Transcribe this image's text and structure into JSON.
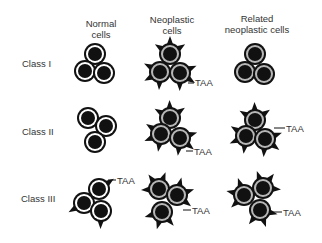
{
  "columns": [
    {
      "id": "normal",
      "line1": "Normal",
      "line2": "cells",
      "x": 101
    },
    {
      "id": "neoplastic",
      "line1": "Neoplastic",
      "line2": "cells",
      "x": 172
    },
    {
      "id": "related",
      "line1": "Related",
      "line2": "neoplastic cells",
      "x": 257
    }
  ],
  "rows": [
    {
      "label": "Class I",
      "y": 64
    },
    {
      "label": "Class II",
      "y": 132
    },
    {
      "label": "Class III",
      "y": 199
    }
  ],
  "annotation_label": "TAA",
  "colors": {
    "outline": "#111111",
    "normal_fill": "#ffffff",
    "neoplastic_fill": "#b8b8b8",
    "nucleus": "#111111",
    "text": "#333333"
  },
  "groups": [
    {
      "row": "Class I",
      "col": "normal",
      "type": "normal",
      "spikes": false,
      "cells": [
        [
          95,
          54
        ],
        [
          85,
          71
        ],
        [
          104,
          73
        ]
      ],
      "taa": null
    },
    {
      "row": "Class I",
      "col": "neoplastic",
      "type": "neoplastic",
      "spikes": true,
      "cells": [
        [
          170,
          54
        ],
        [
          160,
          72
        ],
        [
          180,
          73
        ]
      ],
      "taa": {
        "from": [
          188,
          83
        ],
        "to": [
          194,
          83
        ],
        "text_x": 195,
        "text_y": 86
      }
    },
    {
      "row": "Class I",
      "col": "related",
      "type": "neoplastic",
      "spikes": false,
      "cells": [
        [
          255,
          54
        ],
        [
          245,
          72
        ],
        [
          264,
          74
        ]
      ],
      "taa": null
    },
    {
      "row": "Class II",
      "col": "normal",
      "type": "normal",
      "spikes": false,
      "cells": [
        [
          88,
          118
        ],
        [
          106,
          126
        ],
        [
          95,
          142
        ]
      ],
      "taa": null
    },
    {
      "row": "Class II",
      "col": "neoplastic",
      "type": "neoplastic",
      "spikes": true,
      "cells": [
        [
          170,
          118
        ],
        [
          161,
          134
        ],
        [
          180,
          138
        ]
      ],
      "taa": {
        "from": [
          186,
          151
        ],
        "to": [
          193,
          151
        ],
        "text_x": 194,
        "text_y": 155
      }
    },
    {
      "row": "Class II",
      "col": "related",
      "type": "neoplastic",
      "spikes": true,
      "cells": [
        [
          255,
          120
        ],
        [
          246,
          136
        ],
        [
          265,
          139
        ]
      ],
      "taa": {
        "from": [
          274,
          128
        ],
        "to": [
          285,
          128
        ],
        "text_x": 286,
        "text_y": 132
      }
    },
    {
      "row": "Class III",
      "col": "normal",
      "type": "normal",
      "spikes": "few",
      "cells": [
        [
          99,
          189
        ],
        [
          84,
          203
        ],
        [
          101,
          211
        ]
      ],
      "taa": {
        "from": [
          108,
          180
        ],
        "to": [
          116,
          180
        ],
        "text_x": 117,
        "text_y": 184
      }
    },
    {
      "row": "Class III",
      "col": "neoplastic",
      "type": "neoplastic",
      "spikes": true,
      "cells": [
        [
          159,
          189
        ],
        [
          177,
          195
        ],
        [
          162,
          212
        ]
      ],
      "taa": {
        "from": [
          183,
          210
        ],
        "to": [
          191,
          210
        ],
        "text_x": 192,
        "text_y": 214
      }
    },
    {
      "row": "Class III",
      "col": "related",
      "type": "neoplastic",
      "spikes": true,
      "cells": [
        [
          244,
          195
        ],
        [
          263,
          188
        ],
        [
          260,
          210
        ]
      ],
      "taa": {
        "from": [
          270,
          212
        ],
        "to": [
          282,
          212
        ],
        "text_x": 283,
        "text_y": 216
      }
    }
  ]
}
